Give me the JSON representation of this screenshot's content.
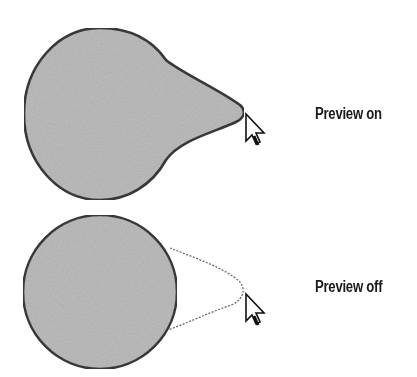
{
  "figure": {
    "panels": [
      {
        "label": "Preview on",
        "state": "on"
      },
      {
        "label": "Preview off",
        "state": "off"
      }
    ],
    "colors": {
      "fill": "#bdbdbd",
      "stroke": "#3a3a3a",
      "preview_outline": "#6a6a6a",
      "text": "#1a1a1a"
    },
    "icons": [
      "arrow-cursor-icon",
      "arrow-cursor-icon"
    ]
  }
}
